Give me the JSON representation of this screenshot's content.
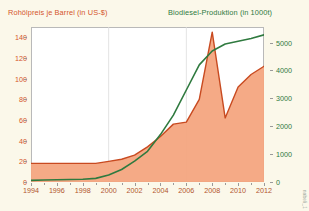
{
  "chart_data": {
    "type": "area",
    "title_left": "Rohölpreis je Barrel (in US-$)",
    "title_right": "Biodiesel-Produktion (in 1000t)",
    "xlabel": "",
    "ylabel": "Rohölpreis je Barrel (in US-$)",
    "y2label": "Biodiesel-Produktion (in 1000t)",
    "grid": true,
    "legend_position": "top",
    "x": [
      1994,
      1995,
      1996,
      1997,
      1998,
      1999,
      2000,
      2001,
      2002,
      2003,
      2004,
      2005,
      2006,
      2007,
      2008,
      2009,
      2010,
      2011,
      2012
    ],
    "xticks": [
      "1994",
      "1996",
      "1998",
      "2000",
      "2002",
      "2004",
      "2006",
      "2008",
      "2010",
      "2012"
    ],
    "xtick_values": [
      1994,
      1996,
      1998,
      2000,
      2002,
      2004,
      2006,
      2008,
      2010,
      2012
    ],
    "xlim": [
      1994,
      2012
    ],
    "yticks": [
      "0",
      "20",
      "40",
      "60",
      "80",
      "100",
      "120",
      "140"
    ],
    "ytick_values": [
      0,
      20,
      40,
      60,
      80,
      100,
      120,
      140
    ],
    "ylim": [
      0,
      150
    ],
    "y2ticks": [
      "0",
      "1000",
      "2000",
      "3000",
      "4000",
      "5000"
    ],
    "y2tick_values": [
      0,
      1000,
      2000,
      3000,
      4000,
      5000
    ],
    "y2lim": [
      0,
      5560
    ],
    "gridlines_x": [
      2000,
      2006
    ],
    "series": [
      {
        "name": "Rohölpreis je Barrel (in US-$)",
        "axis": "left",
        "color": "#c84a20",
        "fill": "#f4a580",
        "values": [
          18,
          18,
          18,
          18,
          18,
          18,
          20,
          22,
          26,
          34,
          44,
          56,
          58,
          80,
          145,
          62,
          92,
          104,
          112
        ]
      },
      {
        "name": "Biodiesel-Produktion (in 1000t)",
        "axis": "right",
        "color": "#2f7a3f",
        "fill": "none",
        "values": [
          60,
          70,
          80,
          90,
          100,
          130,
          250,
          450,
          750,
          1100,
          1700,
          2400,
          3300,
          4200,
          4700,
          4950,
          5050,
          5150,
          5280
        ]
      }
    ],
    "watermark": "nabeli_1"
  },
  "colors": {
    "background": "#fbf8ea",
    "plot_background": "#ffffff",
    "oil_line": "#c84a20",
    "oil_fill": "#f4a580",
    "biodiesel_line": "#2f7a3f",
    "axis": "#9a9a9a",
    "grid": "#dcdcdc"
  }
}
